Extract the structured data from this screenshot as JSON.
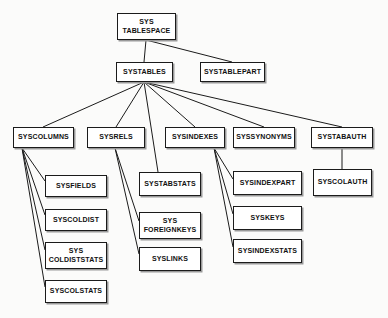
{
  "diagram": {
    "type": "tree-diagram",
    "background_color": "#fbfbfa",
    "node_fill_color": "#ffffff",
    "node_border_color": "#1b1b1b",
    "edge_color": "#1b1b1b",
    "text_color": "#111111",
    "nodes": [
      {
        "id": "systablespace",
        "label": "SYS\nTABLESPACE",
        "x": 117,
        "y": 13,
        "w": 59,
        "h": 27
      },
      {
        "id": "systables",
        "label": "SYSTABLES",
        "x": 116,
        "y": 62,
        "w": 57,
        "h": 20
      },
      {
        "id": "systablepart",
        "label": "SYSTABLEPART",
        "x": 200,
        "y": 62,
        "w": 65,
        "h": 20
      },
      {
        "id": "syscolumns",
        "label": "SYSCOLUMNS",
        "x": 13,
        "y": 127,
        "w": 61,
        "h": 21
      },
      {
        "id": "sysrels",
        "label": "SYSRELS",
        "x": 87,
        "y": 127,
        "w": 58,
        "h": 21
      },
      {
        "id": "sysindexes",
        "label": "SYSINDEXES",
        "x": 165,
        "y": 127,
        "w": 60,
        "h": 21
      },
      {
        "id": "syssynonyms",
        "label": "SYSSYNONYMS",
        "x": 233,
        "y": 127,
        "w": 62,
        "h": 21
      },
      {
        "id": "systabauth",
        "label": "SYSTABAUTH",
        "x": 311,
        "y": 127,
        "w": 62,
        "h": 21
      },
      {
        "id": "sysfields",
        "label": "SYSFIELDS",
        "x": 45,
        "y": 175,
        "w": 62,
        "h": 22
      },
      {
        "id": "syscoldist",
        "label": "SYSCOLDIST",
        "x": 45,
        "y": 209,
        "w": 62,
        "h": 22
      },
      {
        "id": "syscoldiststats",
        "label": "SYS\nCOLDISTSTATS",
        "x": 45,
        "y": 242,
        "w": 62,
        "h": 27
      },
      {
        "id": "syscolstats",
        "label": "SYSCOLSTATS",
        "x": 45,
        "y": 280,
        "w": 62,
        "h": 23
      },
      {
        "id": "systabstats",
        "label": "SYSTABSTATS",
        "x": 139,
        "y": 172,
        "w": 62,
        "h": 24
      },
      {
        "id": "sysforeignkeys",
        "label": "SYS\nFOREIGNKEYS",
        "x": 139,
        "y": 212,
        "w": 62,
        "h": 27
      },
      {
        "id": "syslinks",
        "label": "SYSLINKS",
        "x": 139,
        "y": 247,
        "w": 62,
        "h": 24
      },
      {
        "id": "sysindexpart",
        "label": "SYSINDEXPART",
        "x": 233,
        "y": 171,
        "w": 69,
        "h": 24
      },
      {
        "id": "syskeys",
        "label": "SYSKEYS",
        "x": 233,
        "y": 206,
        "w": 69,
        "h": 24
      },
      {
        "id": "sysindexstats",
        "label": "SYSINDEXSTATS",
        "x": 233,
        "y": 239,
        "w": 69,
        "h": 24
      },
      {
        "id": "syscolauth",
        "label": "SYSCOLAUTH",
        "x": 313,
        "y": 169,
        "w": 59,
        "h": 27
      }
    ],
    "edges": [
      {
        "from": "systablespace",
        "to": "systables",
        "x1": 146,
        "y1": 40,
        "x2": 144,
        "y2": 62
      },
      {
        "from": "systablespace",
        "to": "systablepart",
        "x1": 146,
        "y1": 40,
        "x2": 232,
        "y2": 62
      },
      {
        "from": "systables",
        "to": "syscolumns",
        "x1": 144,
        "y1": 82,
        "x2": 43,
        "y2": 127
      },
      {
        "from": "systables",
        "to": "sysrels",
        "x1": 144,
        "y1": 82,
        "x2": 116,
        "y2": 127
      },
      {
        "from": "systables",
        "to": "systabstats",
        "x1": 144,
        "y1": 82,
        "x2": 158,
        "y2": 172
      },
      {
        "from": "systables",
        "to": "sysindexes",
        "x1": 144,
        "y1": 82,
        "x2": 195,
        "y2": 127
      },
      {
        "from": "systables",
        "to": "syssynonyms",
        "x1": 144,
        "y1": 82,
        "x2": 264,
        "y2": 127
      },
      {
        "from": "systables",
        "to": "systabauth",
        "x1": 144,
        "y1": 82,
        "x2": 342,
        "y2": 127
      },
      {
        "from": "syscolumns",
        "to": "sysfields",
        "x1": 22,
        "y1": 148,
        "x2": 45,
        "y2": 181
      },
      {
        "from": "syscolumns",
        "to": "syscoldist",
        "x1": 22,
        "y1": 148,
        "x2": 45,
        "y2": 215
      },
      {
        "from": "syscolumns",
        "to": "syscoldiststats",
        "x1": 22,
        "y1": 148,
        "x2": 45,
        "y2": 250
      },
      {
        "from": "syscolumns",
        "to": "syscolstats",
        "x1": 22,
        "y1": 148,
        "x2": 45,
        "y2": 287
      },
      {
        "from": "sysrels",
        "to": "sysforeignkeys",
        "x1": 115,
        "y1": 148,
        "x2": 139,
        "y2": 221
      },
      {
        "from": "sysrels",
        "to": "syslinks",
        "x1": 115,
        "y1": 148,
        "x2": 139,
        "y2": 254
      },
      {
        "from": "sysindexes",
        "to": "sysindexpart",
        "x1": 214,
        "y1": 148,
        "x2": 233,
        "y2": 179
      },
      {
        "from": "sysindexes",
        "to": "syskeys",
        "x1": 214,
        "y1": 148,
        "x2": 233,
        "y2": 214
      },
      {
        "from": "sysindexes",
        "to": "sysindexstats",
        "x1": 214,
        "y1": 148,
        "x2": 233,
        "y2": 247
      },
      {
        "from": "systabauth",
        "to": "syscolauth",
        "x1": 342,
        "y1": 148,
        "x2": 342,
        "y2": 169
      }
    ]
  }
}
